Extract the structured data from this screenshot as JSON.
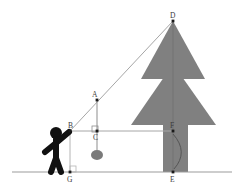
{
  "diagram": {
    "background_color": "#ffffff",
    "line_color": "#9b9b9b",
    "tree_color": "#808080",
    "figure_color": "#111111",
    "label_color": "#3b3b3b",
    "point_color": "#1a1a1a"
  },
  "points": {
    "A": {
      "label": "A",
      "x": 97,
      "y": 100,
      "label_x": 92,
      "label_y": 97
    },
    "B": {
      "label": "B",
      "x": 70,
      "y": 131,
      "label_x": 68,
      "label_y": 128
    },
    "C": {
      "label": "C",
      "x": 97,
      "y": 131,
      "label_x": 93,
      "label_y": 140
    },
    "D": {
      "label": "D",
      "x": 173,
      "y": 21,
      "label_x": 170,
      "label_y": 18
    },
    "E": {
      "label": "E",
      "x": 173,
      "y": 172,
      "label_x": 170,
      "label_y": 182
    },
    "F": {
      "label": "F",
      "x": 173,
      "y": 131,
      "label_x": 170,
      "label_y": 128
    },
    "G": {
      "label": "G",
      "x": 70,
      "y": 172,
      "label_x": 67,
      "label_y": 182
    }
  },
  "segments": {
    "ground_line": {
      "name": "ground",
      "x1": 12,
      "y1": 172,
      "x2": 232,
      "y2": 172
    },
    "sight_line": {
      "name": "line-of-sight-B-to-D",
      "x1": 70,
      "y1": 131,
      "x2": 173,
      "y2": 21
    },
    "horizontal_line": {
      "name": "horizontal-B-to-F",
      "x1": 70,
      "y1": 131,
      "x2": 173,
      "y2": 131
    },
    "plumb_line": {
      "name": "plumb-A-to-bob",
      "x1": 97,
      "y1": 100,
      "x2": 97,
      "y2": 150
    },
    "vertical_BG": {
      "name": "vertical-B-to-G",
      "x1": 70,
      "y1": 131,
      "x2": 70,
      "y2": 172
    },
    "tree_axis": {
      "name": "tree-axis-D-to-E",
      "x1": 173,
      "y1": 21,
      "x2": 173,
      "y2": 172
    }
  },
  "right_angles": [
    {
      "name": "right-angle-at-C",
      "x": 92,
      "y": 126,
      "size": 6
    },
    {
      "name": "right-angle-at-G",
      "x": 70,
      "y": 166,
      "size": 6
    }
  ],
  "plumb_bob": {
    "name": "plumb-bob",
    "cx": 97,
    "cy": 155,
    "rx": 6,
    "ry": 5
  },
  "arc_at_F": {
    "name": "angle-arc-at-F",
    "path": "M 173 134 Q 189 152 174 169"
  },
  "tree": {
    "upper_triangle": "141,79 173,21 205,79",
    "upper_notch": "150,74 173,74 196,74",
    "lower_triangle": "131,125 173,64 216,125",
    "trunk": {
      "x": 163,
      "y": 125,
      "width": 25,
      "height": 47
    }
  },
  "person": {
    "name": "observer-stick-figure",
    "head": {
      "cx": 56,
      "cy": 133,
      "r": 6
    },
    "body": "M 56 139 L 56 158 M 56 158 L 51 172 M 56 158 L 61 172 M 56 143 L 45 152 M 56 143 L 69 132",
    "torso_width": 6
  },
  "labels_order": [
    "D",
    "A",
    "B",
    "C",
    "F",
    "G",
    "E"
  ]
}
